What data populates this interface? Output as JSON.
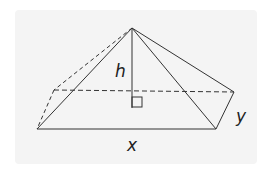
{
  "diagram": {
    "type": "square-based pyramid",
    "labels": {
      "height": "h",
      "length": "x",
      "width": "y"
    },
    "colors": {
      "background": "#f4f4f4",
      "line": "#333333"
    },
    "vertices": {
      "apex": [
        132,
        28
      ],
      "front_left": [
        37,
        129
      ],
      "front_right": [
        216,
        129
      ],
      "back_right": [
        234,
        92
      ],
      "back_left": [
        54,
        90
      ],
      "base_foot": [
        132,
        91
      ]
    }
  }
}
